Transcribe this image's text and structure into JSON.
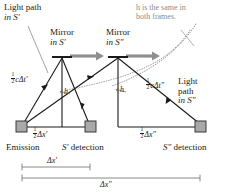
{
  "figure": {
    "type": "physics-diagram"
  },
  "annotations": {
    "light_path_s1": {
      "line1": "Light path",
      "line2": "in S′"
    },
    "mirror_s1": {
      "line1": "Mirror",
      "line2": "in S′"
    },
    "mirror_s2": {
      "line1": "Mirror",
      "line2": "in S″"
    },
    "h_note": {
      "line1": "h is the same in",
      "line2": "both frames."
    },
    "light_path_s2": {
      "line1": "Light",
      "line2": "path",
      "line3": "in S″"
    },
    "half_c_dt1": {
      "prefix": "",
      "num": "1",
      "den": "2",
      "body": "cΔt′"
    },
    "half_c_dt2": {
      "num": "1",
      "den": "2",
      "body": "cΔt″"
    },
    "half_dx1": {
      "num": "1",
      "den": "2",
      "body": "Δx′"
    },
    "half_dx2": {
      "num": "1",
      "den": "2",
      "body": "Δx″"
    },
    "h_left": "h",
    "h_right": "h",
    "emission": "Emission",
    "detection_s1": "S′ detection",
    "detection_s2": "S″ detection",
    "dx1_bar": "Δx′",
    "dx2_bar": "Δx″"
  },
  "colors": {
    "ink": "#1a1a1a",
    "gray_arrow": "#8f8f8f",
    "gray_text": "#8a8a8a",
    "gray_dotted": "#9a9a9a",
    "detector_fill": "#a9a9a9",
    "detector_stroke": "#3a3a3a",
    "leader": "#8a8a8a"
  },
  "geometry": {
    "mirror1_apex": [
      62,
      57
    ],
    "mirror2_apex": [
      118,
      57
    ],
    "emission_point": [
      22,
      127
    ],
    "detector_s1": [
      90,
      127
    ],
    "detector_s2": [
      200,
      127
    ],
    "baseline_y": 127,
    "dx1_bar": {
      "x1": 22,
      "x2": 90,
      "y": 167
    },
    "dx2_bar": {
      "x1": 22,
      "x2": 200,
      "y": 180
    }
  }
}
